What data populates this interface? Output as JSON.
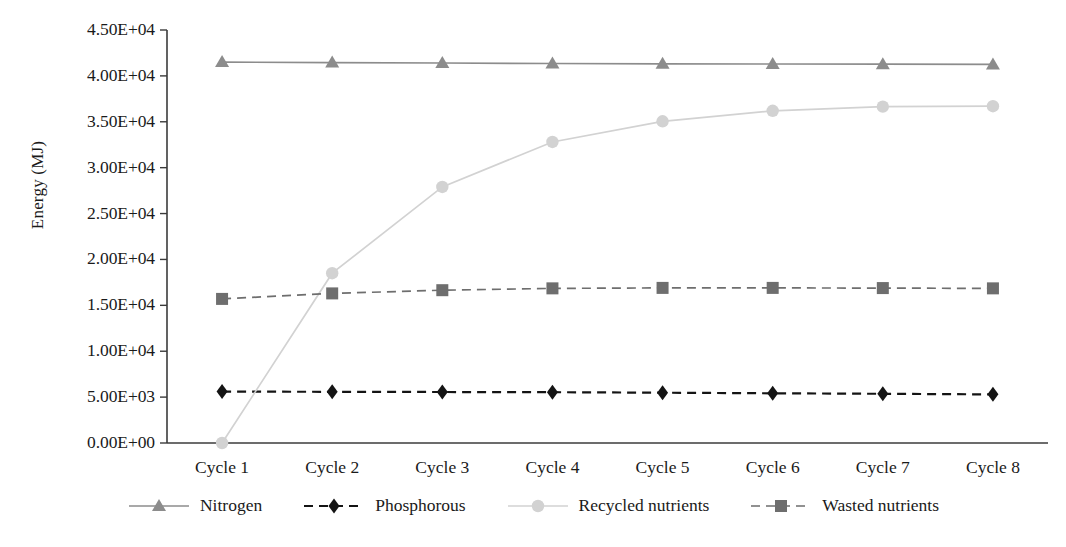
{
  "chart_data": {
    "type": "line",
    "title": "",
    "xlabel": "",
    "ylabel": "Energy (MJ)",
    "categories": [
      "Cycle 1",
      "Cycle 2",
      "Cycle 3",
      "Cycle 4",
      "Cycle 5",
      "Cycle 6",
      "Cycle 7",
      "Cycle 8"
    ],
    "ylim": [
      0,
      45000
    ],
    "ytick_labels": [
      "0.00E+00",
      "5.00E+03",
      "1.00E+04",
      "1.50E+04",
      "2.00E+04",
      "2.50E+04",
      "3.00E+04",
      "3.50E+04",
      "4.00E+04",
      "4.50E+04"
    ],
    "ytick_values": [
      0,
      5000,
      10000,
      15000,
      20000,
      25000,
      30000,
      35000,
      40000,
      45000
    ],
    "grid": false,
    "legend_position": "bottom",
    "series": [
      {
        "name": "Nitrogen",
        "color": "#8c8c8c",
        "marker": "triangle",
        "dash": "solid",
        "values": [
          41500,
          41450,
          41400,
          41350,
          41320,
          41300,
          41280,
          41250
        ]
      },
      {
        "name": "Phosphorous",
        "color": "#141414",
        "marker": "diamond",
        "dash": "dashed",
        "values": [
          5600,
          5580,
          5560,
          5540,
          5480,
          5420,
          5360,
          5300
        ]
      },
      {
        "name": "Recycled nutrients",
        "color": "#d2d2d2",
        "marker": "circle",
        "dash": "solid",
        "values": [
          0,
          18500,
          27900,
          32800,
          35050,
          36200,
          36650,
          36700
        ]
      },
      {
        "name": "Wasted nutrients",
        "color": "#6e6e6e",
        "marker": "square",
        "dash": "dashed",
        "values": [
          15700,
          16300,
          16650,
          16850,
          16900,
          16900,
          16880,
          16850
        ]
      }
    ]
  },
  "axis": {
    "line_color": "#3b3b3b"
  }
}
